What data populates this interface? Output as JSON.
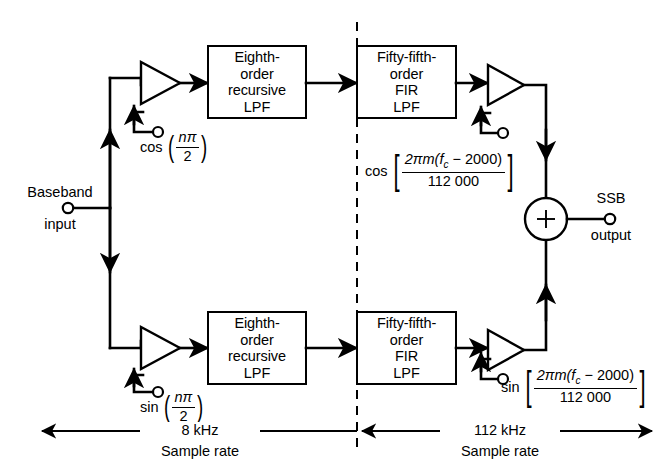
{
  "diagram": {
    "ports": {
      "input_label_line1": "Baseband",
      "input_label_line2": "input",
      "output_label_line1": "SSB",
      "output_label_line2": "output"
    },
    "blocks": {
      "iir_top": "Eighth-\norder\nrecursive\nLPF",
      "iir_bottom": "Eighth-\norder\nrecursive\nLPF",
      "fir_top": "Fifty-fifth-\norder\nFIR\nLPF",
      "fir_bottom": "Fifty-fifth-\norder\nFIR\nLPF"
    },
    "mixers": {
      "top_left": {
        "fn": "cos",
        "numerator": "nπ",
        "denominator": "2",
        "open_paren": "(",
        "close_paren": ")"
      },
      "bottom_left": {
        "fn": "sin",
        "numerator": "nπ",
        "denominator": "2",
        "open_paren": "(",
        "close_paren": ")"
      },
      "top_right": {
        "fn": "cos",
        "numerator_a": "2πm",
        "numerator_b": "(f",
        "numerator_sub": "c",
        "numerator_c": " − 2000)",
        "denominator": "112 000",
        "open_bracket": "[",
        "close_bracket": "]"
      },
      "bottom_right": {
        "fn": "sin",
        "numerator_a": "2πm",
        "numerator_b": "(f",
        "numerator_sub": "c",
        "numerator_c": " − 2000)",
        "denominator": "112 000",
        "open_bracket": "[",
        "close_bracket": "]"
      }
    },
    "summer": {
      "symbol": "+"
    },
    "sample_rates": {
      "left_rate": "8 kHz",
      "left_caption": "Sample rate",
      "right_rate": "112 kHz",
      "right_caption": "Sample rate"
    },
    "colors": {
      "ink": "#000000",
      "paper": "#ffffff"
    }
  }
}
